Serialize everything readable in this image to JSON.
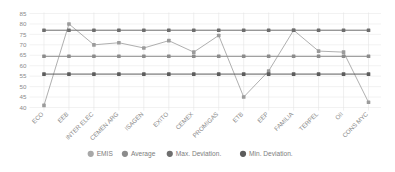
{
  "chart_data": {
    "type": "line",
    "title": "",
    "xlabel": "",
    "ylabel": "",
    "ylim": [
      40,
      85
    ],
    "ytick_step": 5,
    "yticks": [
      40,
      45,
      50,
      55,
      60,
      65,
      70,
      75,
      80,
      85
    ],
    "grid": true,
    "legend_position": "bottom",
    "categories": [
      "ECO",
      "EEB",
      "INTER ELEC",
      "CEMEN ARG",
      "ISAGEN",
      "EXITO",
      "CEMEX",
      "PROMIGAS",
      "ETB",
      "EEP",
      "FAMILIA",
      "TERPEL",
      "OII",
      "CONS MYC"
    ],
    "series": [
      {
        "name": "EMIS",
        "color": "#9b9b9b",
        "values": [
          41,
          80,
          70,
          71,
          68.5,
          72,
          66.5,
          74.5,
          45,
          57.5,
          77,
          67,
          66.5,
          42.5
        ]
      },
      {
        "name": "Average",
        "color": "#8c8c8c",
        "values": [
          64.5,
          64.5,
          64.5,
          64.5,
          64.5,
          64.5,
          64.5,
          64.5,
          64.5,
          64.5,
          64.5,
          64.5,
          64.5,
          64.5
        ]
      },
      {
        "name": "Max. Deviation.",
        "color": "#6e6e6e",
        "values": [
          77,
          77,
          77,
          77,
          77,
          77,
          77,
          77,
          77,
          77,
          77,
          77,
          77,
          77
        ]
      },
      {
        "name": "Min. Deviation.",
        "color": "#5c5c5c",
        "values": [
          56,
          56,
          56,
          56,
          56,
          56,
          56,
          56,
          56,
          56,
          56,
          56,
          56,
          56
        ]
      }
    ]
  },
  "legend": {
    "items": [
      {
        "label": "EMIS",
        "color": "#a8a8a8"
      },
      {
        "label": "Average",
        "color": "#8c8c8c"
      },
      {
        "label": "Max. Deviation.",
        "color": "#6e6e6e"
      },
      {
        "label": "Min. Deviation.",
        "color": "#5c5c5c"
      }
    ]
  },
  "axes": {
    "y_tick_labels": [
      "85",
      "80",
      "75",
      "70",
      "65",
      "60",
      "55",
      "50",
      "45",
      "40"
    ]
  },
  "colors": {
    "background": "#ffffff",
    "gridline": "#e9e9e9",
    "tick_text": "#8a8a8a"
  }
}
